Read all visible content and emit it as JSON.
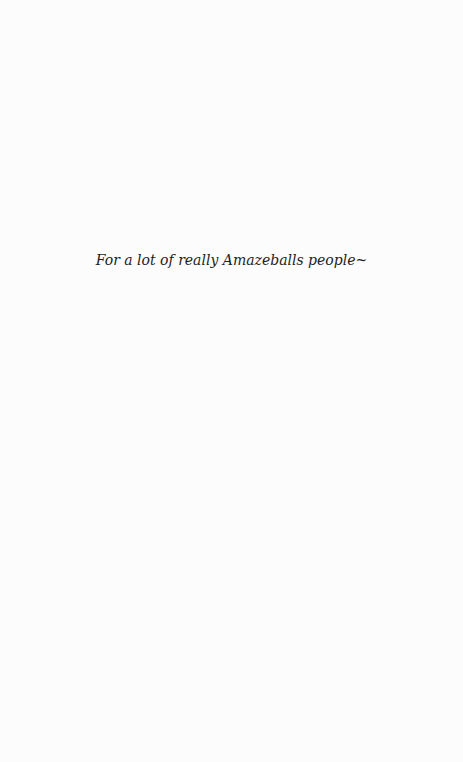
{
  "page": {
    "background_color": "#fcfcfc",
    "text_color": "#1e1e1e",
    "dedication": "For a lot of really Amazeballs people~"
  }
}
